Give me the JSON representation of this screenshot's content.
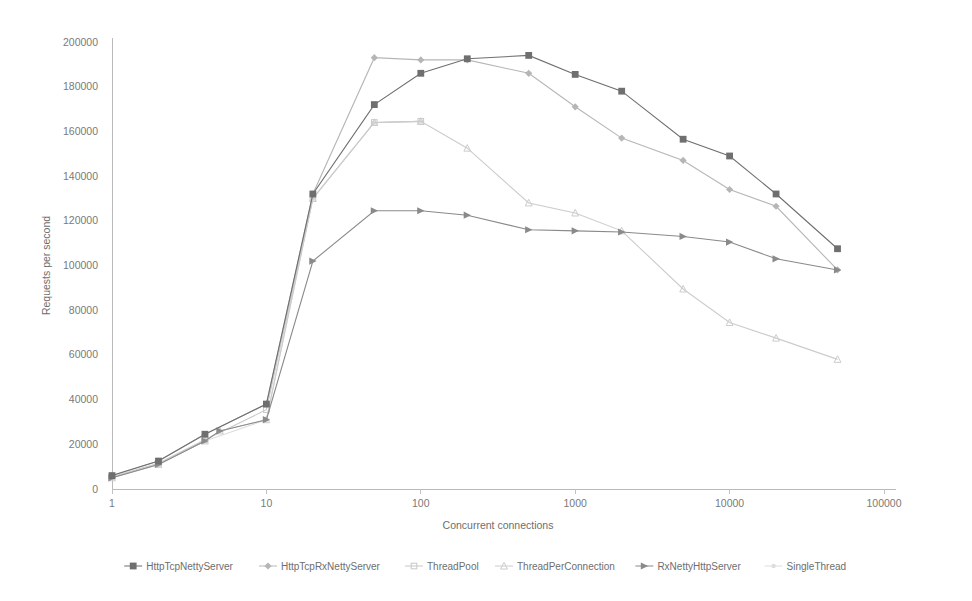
{
  "chart_data": {
    "type": "line",
    "title": "",
    "xlabel": "Concurrent connections",
    "ylabel": "Requests per second",
    "xscale": "log",
    "xlim": [
      1,
      100000
    ],
    "ylim": [
      0,
      200000
    ],
    "grid": false,
    "legend_position": "bottom",
    "x_tick_labels": [
      "1",
      "10",
      "100",
      "1000",
      "10000",
      "100000"
    ],
    "x_tick_values": [
      1,
      10,
      100,
      1000,
      10000,
      100000
    ],
    "y_tick_labels": [
      "0",
      "20000",
      "40000",
      "60000",
      "80000",
      "100000",
      "120000",
      "140000",
      "160000",
      "180000",
      "200000"
    ],
    "y_tick_values": [
      0,
      20000,
      40000,
      60000,
      80000,
      100000,
      120000,
      140000,
      160000,
      180000,
      200000
    ],
    "series": [
      {
        "name": "HttpTcpNettyServer",
        "color": "#6f6f6f",
        "marker": "square",
        "x": [
          1,
          2,
          4,
          10,
          20,
          50,
          100,
          200,
          500,
          1000,
          2000,
          5000,
          10000,
          20000,
          50000
        ],
        "values": [
          6000,
          12500,
          24500,
          38000,
          132000,
          172000,
          186000,
          192500,
          194000,
          185500,
          178000,
          156500,
          149000,
          132000,
          107500
        ]
      },
      {
        "name": "HttpTcpRxNettyServer",
        "color": "#b6b6b6",
        "marker": "diamond",
        "x": [
          1,
          2,
          4,
          10,
          20,
          50,
          100,
          200,
          500,
          1000,
          2000,
          5000,
          10000,
          20000,
          50000
        ],
        "values": [
          6000,
          12500,
          24500,
          38000,
          132000,
          193000,
          192000,
          192000,
          186000,
          171000,
          157000,
          147000,
          134000,
          126500,
          98000
        ]
      },
      {
        "name": "ThreadPool",
        "color": "#c8c8c8",
        "marker": "square-open",
        "x": [
          1,
          2,
          4,
          10,
          20,
          50,
          100
        ],
        "values": [
          5500,
          11500,
          22000,
          35500,
          130000,
          164000,
          164500
        ]
      },
      {
        "name": "ThreadPerConnection",
        "color": "#cccccc",
        "marker": "triangle",
        "x": [
          1,
          2,
          4,
          5,
          10,
          20,
          50,
          100,
          200,
          500,
          1000,
          2000,
          5000,
          10000,
          20000,
          50000
        ],
        "values": [
          5000,
          11000,
          21500,
          26000,
          31000,
          130000,
          164000,
          164500,
          152500,
          128000,
          123500,
          115500,
          89500,
          74500,
          67500,
          58000
        ]
      },
      {
        "name": "RxNettyHttpServer",
        "color": "#8a8a8a",
        "marker": "arrow",
        "x": [
          1,
          2,
          4,
          5,
          10,
          20,
          50,
          100,
          200,
          500,
          1000,
          2000,
          5000,
          10000,
          20000,
          50000
        ],
        "values": [
          5000,
          11000,
          21500,
          26000,
          31000,
          102000,
          124500,
          124500,
          122500,
          116000,
          115500,
          115000,
          113000,
          110500,
          103000,
          98000
        ]
      },
      {
        "name": "SingleThread",
        "color": "#dedede",
        "marker": "dot",
        "x": [
          1,
          2,
          4,
          10,
          20,
          50,
          100
        ],
        "values": [
          5000,
          11000,
          21500,
          31000,
          130000,
          164000,
          164500
        ]
      }
    ]
  },
  "legend": {
    "items": [
      {
        "label": "HttpTcpNettyServer",
        "color": "#6f6f6f",
        "marker": "square"
      },
      {
        "label": "HttpTcpRxNettyServer",
        "color": "#b6b6b6",
        "marker": "diamond"
      },
      {
        "label": "ThreadPool",
        "color": "#c8c8c8",
        "marker": "square-open"
      },
      {
        "label": "ThreadPerConnection",
        "color": "#cccccc",
        "marker": "triangle"
      },
      {
        "label": "RxNettyHttpServer",
        "color": "#8a8a8a",
        "marker": "arrow"
      },
      {
        "label": "SingleThread",
        "color": "#dedede",
        "marker": "dot"
      }
    ]
  }
}
